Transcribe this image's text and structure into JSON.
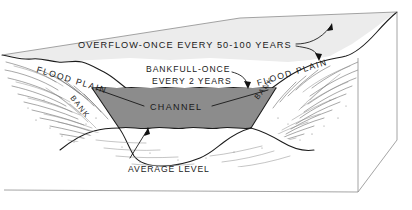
{
  "figure": {
    "type": "block-diagram",
    "background_color": "#ffffff"
  },
  "labels": {
    "overflow": "OVERFLOW-ONCE EVERY 50-100 YEARS",
    "bankfull_line1": "BANKFULL-ONCE",
    "bankfull_line2": "EVERY 2 YEARS",
    "channel": "CHANNEL",
    "average_level": "AVERAGE LEVEL",
    "flood_plain_left": "FLOOD PLAIN",
    "flood_plain_right": "FLOOD PLAIN",
    "bank_left": "BANK",
    "bank_right": "BANK"
  },
  "colors": {
    "ink": "#1b1b1b",
    "channel_water_fill": "#8c8c8c",
    "flood_plain_surface_fill": "#ececec",
    "block_face_fill": "#ffffff",
    "hatching": "#5f5f5f",
    "label_text": "#1a1a1a"
  },
  "annotations": {
    "overflow_arrow_count": 2,
    "channel_leader_count": 2,
    "bankfull_leader_count": 1,
    "average_level_leader_count": 1
  }
}
